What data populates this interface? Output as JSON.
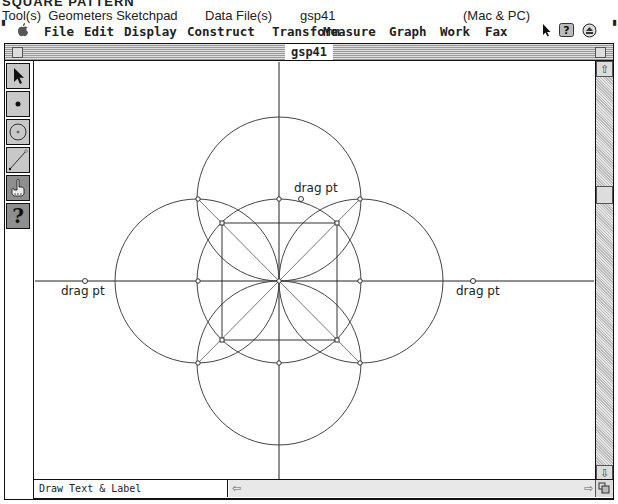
{
  "caption": {
    "title": "SQUARE PATTERN",
    "tools_label": "Tool(s)",
    "tools_value": "Geometers Sketchpad",
    "datafile_label": "Data File(s)",
    "datafile_value": "gsp41",
    "platform": "(Mac & PC)"
  },
  "menubar": {
    "items": [
      "File",
      "Edit",
      "Display",
      "Construct",
      "Transform",
      "Measure",
      "Graph",
      "Work",
      "Fax"
    ],
    "right_icons": [
      "pointer-icon",
      "help-balloon-icon",
      "application-menu-icon"
    ]
  },
  "window": {
    "title": "gsp41"
  },
  "toolbox": {
    "tools": [
      {
        "name": "selection-arrow-tool",
        "icon": "arrow"
      },
      {
        "name": "point-tool",
        "icon": "point"
      },
      {
        "name": "compass-tool",
        "icon": "circle"
      },
      {
        "name": "straightedge-tool",
        "icon": "segment"
      },
      {
        "name": "text-tool",
        "icon": "hand",
        "active": true
      },
      {
        "name": "object-info-tool",
        "icon": "?"
      }
    ]
  },
  "canvas": {
    "labels": {
      "left": "drag pt",
      "right": "drag pt",
      "top": "drag pt"
    }
  },
  "status": {
    "text": "Draw Text & Label"
  },
  "scroll": {
    "up": "⇧",
    "down": "⇩",
    "left": "⇦",
    "right": "⇨"
  }
}
